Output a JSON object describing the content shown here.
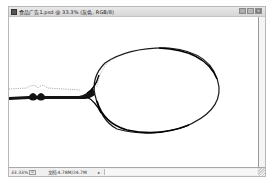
{
  "window": {
    "title": "食品广告1.psd @ 33.3% (灰色, RGB/8)",
    "controls": {
      "minimize": "–",
      "maximize": "□",
      "close": "×"
    }
  },
  "canvas": {
    "subject": "spoon-outline",
    "background_color": "#ffffff",
    "stroke_color": "#111111"
  },
  "statusbar": {
    "zoom": "33.33%",
    "info_icon": "⊙",
    "doc_size": "文档:4.78M/24.7M",
    "menu_arrow": "▸"
  }
}
